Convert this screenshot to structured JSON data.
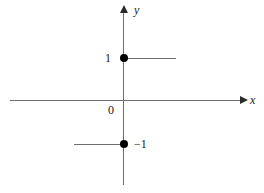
{
  "chart_data": {
    "type": "line",
    "title": "",
    "xlabel": "x",
    "ylabel": "y",
    "origin_label": "0",
    "grid": false,
    "legend": null,
    "xlim": [
      -3.5,
      4.0
    ],
    "ylim": [
      -2.6,
      2.4
    ],
    "axis_labels": {
      "x": "x",
      "y": "y"
    },
    "tick_labels": {
      "y_positive": "1",
      "y_negative": "−1",
      "origin": "0"
    },
    "series": [
      {
        "name": "upper-branch",
        "kind": "ray",
        "y": 1,
        "x_start": 0,
        "x_end": 1.7,
        "endpoint_marker": "filled-circle",
        "endpoint_x": 0,
        "direction": "right"
      },
      {
        "name": "lower-branch",
        "kind": "ray",
        "y": -1,
        "x_start": -1.6,
        "x_end": 0,
        "endpoint_marker": "filled-circle",
        "endpoint_x": 0,
        "direction": "left"
      }
    ],
    "annotations": [
      {
        "text": "1",
        "x": -0.55,
        "y": 1
      },
      {
        "text": "−1",
        "x": 0.35,
        "y": -1
      },
      {
        "text": "0",
        "x": -0.5,
        "y": -0.18
      }
    ]
  },
  "figure": {
    "axes": {
      "x_axis_name": "x-axis",
      "y_axis_name": "y-axis",
      "x_arrow": "arrow-right",
      "y_arrow": "arrow-up"
    },
    "colors": {
      "axis": "#6e6e6e",
      "arrow": "#2b2b2b",
      "marker": "#000000",
      "text": "#1a1a1a",
      "background": "#ffffff"
    }
  }
}
